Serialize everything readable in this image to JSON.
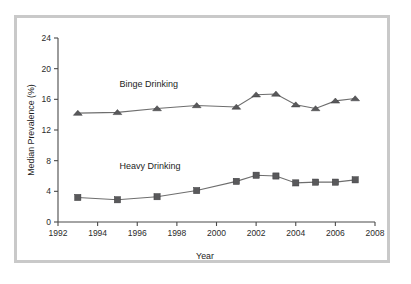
{
  "chart_data": {
    "type": "line",
    "title": "",
    "xlabel": "Year",
    "ylabel": "Median Prevalence (%)",
    "xlim": [
      1992,
      2008
    ],
    "ylim": [
      0,
      24
    ],
    "grid": false,
    "legend_position": "inline-annotation",
    "xticks": [
      1992,
      1994,
      1996,
      1998,
      2000,
      2002,
      2004,
      2006,
      2008
    ],
    "yticks": [
      0,
      4,
      8,
      12,
      16,
      20,
      24
    ],
    "series": [
      {
        "name": "Binge Drinking",
        "marker": "triangle",
        "color": "#59595b",
        "x": [
          1993,
          1995,
          1997,
          1999,
          2001,
          2002,
          2003,
          2004,
          2005,
          2006,
          2007
        ],
        "values": [
          14.2,
          14.3,
          14.8,
          15.2,
          15.0,
          16.6,
          16.7,
          15.3,
          14.8,
          15.8,
          16.1
        ]
      },
      {
        "name": "Heavy Drinking",
        "marker": "square",
        "color": "#6b6b6d",
        "x": [
          1993,
          1995,
          1997,
          1999,
          2001,
          2002,
          2003,
          2004,
          2005,
          2006,
          2007
        ],
        "values": [
          3.2,
          2.9,
          3.3,
          4.1,
          5.3,
          6.1,
          6.0,
          5.1,
          5.2,
          5.2,
          5.5
        ]
      }
    ],
    "annotations": [
      {
        "text": "Binge Drinking",
        "x": 1995.1,
        "y": 17.6
      },
      {
        "text": "Heavy Drinking",
        "x": 1995.1,
        "y": 6.9
      }
    ]
  }
}
